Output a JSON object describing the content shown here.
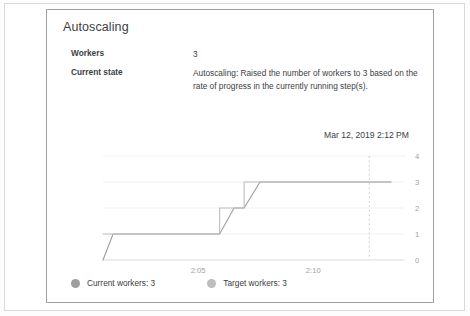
{
  "card": {
    "title": "Autoscaling",
    "timestamp": "Mar 12, 2019 2:12 PM",
    "details": [
      {
        "key": "Workers",
        "value": "3"
      },
      {
        "key": "Current state",
        "value": "Autoscaling: Raised the number of workers to 3 based on the rate of progress in the currently running step(s)."
      }
    ]
  },
  "legend": [
    {
      "label": "Current workers: 3",
      "color": "#9e9e9e"
    },
    {
      "label": "Target workers: 3",
      "color": "#bdbdbd"
    }
  ],
  "chart_data": {
    "type": "line",
    "title": "",
    "xlabel": "",
    "ylabel": "",
    "ylim": [
      0,
      4
    ],
    "yticks": [
      0,
      1,
      2,
      3,
      4
    ],
    "ytick_labels": [
      "0",
      "1",
      "2",
      "3",
      "4"
    ],
    "yaxis_position": "right",
    "xticks": [
      "2:05",
      "2:10"
    ],
    "xtick_positions": [
      0.33,
      0.73
    ],
    "grid": true,
    "grid_axis": "y",
    "marker_line": {
      "label": "now",
      "x": 0.925,
      "style": "dotted"
    },
    "series": [
      {
        "name": "Current workers: 3",
        "color": "#9e9e9e",
        "interpolation": "linear-ramp",
        "x": [
          0.0,
          0.035,
          0.405,
          0.455,
          0.49,
          0.545,
          1.0
        ],
        "values": [
          0,
          1,
          1,
          2,
          2,
          3,
          3
        ]
      },
      {
        "name": "Target workers: 3",
        "color": "#bdbdbd",
        "interpolation": "step",
        "x": [
          0.0,
          0.405,
          0.49,
          1.0
        ],
        "values": [
          1,
          2,
          3,
          3
        ]
      }
    ]
  }
}
